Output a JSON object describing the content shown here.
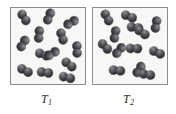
{
  "figure": {
    "type": "molecular-diagram",
    "background_color": "#ffffff",
    "panel_fill": "#f7f7f5",
    "panel_border_color": "#8d8d8d",
    "molecule_color": "#3a3a3f"
  },
  "panels": [
    {
      "id": "panel-left",
      "label_text": "T",
      "label_subscript": "1",
      "molecule_count": 13,
      "molecules": [
        {
          "x": 5,
          "y": 5,
          "rot": 58
        },
        {
          "x": 30,
          "y": 4,
          "rot": 112
        },
        {
          "x": 52,
          "y": 10,
          "rot": 150
        },
        {
          "x": 20,
          "y": 22,
          "rot": 96
        },
        {
          "x": 43,
          "y": 24,
          "rot": 72
        },
        {
          "x": 4,
          "y": 31,
          "rot": 120
        },
        {
          "x": 58,
          "y": 37,
          "rot": 88
        },
        {
          "x": 24,
          "y": 42,
          "rot": 20
        },
        {
          "x": 33,
          "y": 41,
          "rot": 150
        },
        {
          "x": 50,
          "y": 52,
          "rot": 38
        },
        {
          "x": 6,
          "y": 58,
          "rot": 28
        },
        {
          "x": 26,
          "y": 60,
          "rot": 8
        },
        {
          "x": 48,
          "y": 65,
          "rot": 14
        }
      ]
    },
    {
      "id": "panel-right",
      "label_text": "T",
      "label_subscript": "2",
      "molecule_count": 13,
      "molecules": [
        {
          "x": 6,
          "y": 5,
          "rot": 62
        },
        {
          "x": 28,
          "y": 4,
          "rot": 22
        },
        {
          "x": 55,
          "y": 12,
          "rot": 100
        },
        {
          "x": 14,
          "y": 22,
          "rot": 100
        },
        {
          "x": 34,
          "y": 15,
          "rot": 8
        },
        {
          "x": 41,
          "y": 20,
          "rot": 34
        },
        {
          "x": 4,
          "y": 34,
          "rot": 46
        },
        {
          "x": 18,
          "y": 38,
          "rot": 130
        },
        {
          "x": 33,
          "y": 36,
          "rot": 2
        },
        {
          "x": 56,
          "y": 40,
          "rot": 24
        },
        {
          "x": 16,
          "y": 58,
          "rot": 6
        },
        {
          "x": 38,
          "y": 57,
          "rot": 122
        },
        {
          "x": 46,
          "y": 62,
          "rot": 10
        }
      ]
    }
  ]
}
